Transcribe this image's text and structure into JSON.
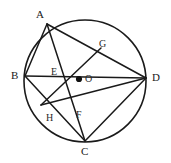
{
  "figure": {
    "kind": "circle-geometry-diagram",
    "width": 171,
    "height": 163,
    "background_color": "#ffffff",
    "stroke_color": "#1a1a1a"
  },
  "circle": {
    "name": "circumscribed-circle",
    "center_x": 85,
    "center_y": 81,
    "radius": 61,
    "stroke_width": 1.6
  },
  "center_point": {
    "label": "O",
    "x": 79,
    "y": 79,
    "dot_radius": 3.1,
    "label_x": 85,
    "label_y": 74
  },
  "vertices": [
    {
      "label": "A",
      "x": 47,
      "y": 24,
      "label_x": 36,
      "label_y": 9
    },
    {
      "label": "B",
      "x": 25,
      "y": 76,
      "label_x": 11,
      "label_y": 70
    },
    {
      "label": "C",
      "x": 85,
      "y": 141,
      "label_x": 81,
      "label_y": 146
    },
    {
      "label": "D",
      "x": 146,
      "y": 78,
      "label_x": 152,
      "label_y": 72
    }
  ],
  "intersections": [
    {
      "label": "E",
      "x": 58,
      "y": 66,
      "label_x": 51,
      "label_y": 67
    },
    {
      "label": "G",
      "x": 101,
      "y": 48,
      "label_x": 99,
      "label_y": 39
    },
    {
      "label": "F",
      "x": 78,
      "y": 108,
      "label_x": 76,
      "label_y": 110
    },
    {
      "label": "H",
      "x": 55,
      "y": 115,
      "label_x": 46,
      "label_y": 113
    }
  ],
  "chords": [
    {
      "name": "chord-AB",
      "from": "A",
      "to": "B",
      "x1": 47,
      "y1": 24,
      "x2": 25,
      "y2": 76
    },
    {
      "name": "chord-AC",
      "from": "A",
      "to": "C",
      "x1": 47,
      "y1": 24,
      "x2": 85,
      "y2": 141
    },
    {
      "name": "chord-AD",
      "from": "A",
      "to": "D",
      "x1": 47,
      "y1": 24,
      "x2": 146,
      "y2": 78
    },
    {
      "name": "chord-BD",
      "from": "B",
      "to": "D",
      "x1": 25,
      "y1": 76,
      "x2": 146,
      "y2": 78
    },
    {
      "name": "chord-BC",
      "from": "B",
      "to": "C",
      "x1": 25,
      "y1": 76,
      "x2": 85,
      "y2": 141
    },
    {
      "name": "chord-CD",
      "from": "C",
      "to": "D",
      "x1": 85,
      "y1": 141,
      "x2": 146,
      "y2": 78
    },
    {
      "name": "chord-G-to-F-lower",
      "from": "G",
      "to": "H",
      "x1": 101,
      "y1": 48,
      "x2": 41,
      "y2": 105
    },
    {
      "name": "chord-F-to-D",
      "from": "F",
      "to": "D",
      "x1": 41,
      "y1": 105,
      "x2": 146,
      "y2": 78
    }
  ]
}
